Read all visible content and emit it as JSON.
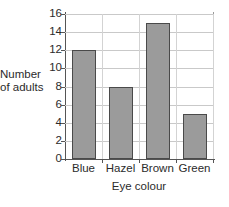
{
  "chart_data": {
    "type": "bar",
    "title": "",
    "categories": [
      "Blue",
      "Hazel",
      "Brown",
      "Green"
    ],
    "values": [
      12,
      8,
      15,
      5
    ],
    "xlabel": "Eye colour",
    "ylabel": "Number of adults",
    "ylabel_lines": [
      "Number",
      "of adults"
    ],
    "ylim": [
      0,
      16
    ],
    "ytick_step": 2,
    "yticks": [
      0,
      2,
      4,
      6,
      8,
      10,
      12,
      14,
      16
    ],
    "ytick_labels": [
      "0",
      "2",
      "4",
      "6",
      "8",
      "10",
      "12",
      "14",
      "16"
    ],
    "grid": true,
    "grid_axis": "both",
    "legend": false,
    "legend_position": "none",
    "bar_fill_color": "#9b9b9b",
    "bar_edge_color": "#4a4a4a",
    "gridline_color": "#c9c9c9",
    "axis_color": "#555555",
    "background_color": "#ffffff"
  }
}
